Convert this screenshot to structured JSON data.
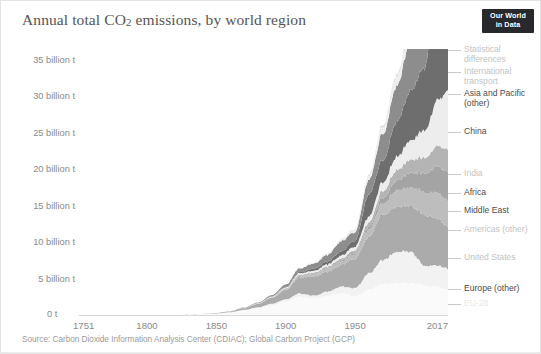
{
  "header": {
    "title_main": "Annual total CO",
    "title_sub": "2",
    "title_rest": " emissions, by world region",
    "logo_line1": "Our World",
    "logo_line2": "in Data"
  },
  "source": {
    "text": "Source: Carbon Dioxide Information Analysis Center (CDIAC); Global Carbon Project (GCP)"
  },
  "legend": [
    {
      "label": "Statistical\ndifferences",
      "color": "#e0e0e0",
      "top": 0
    },
    {
      "label": "International\ntransport",
      "color": "#efefef",
      "top": 22
    },
    {
      "label": "Asia and Pacific\n(other)",
      "color": "#8d8d8d",
      "top": 44
    },
    {
      "label": "China",
      "color": "#6e6e6e",
      "top": 82
    },
    {
      "label": "India",
      "color": "#ededed",
      "top": 124
    },
    {
      "label": "Africa",
      "color": "#b4b4b4",
      "top": 143
    },
    {
      "label": "Middle East",
      "color": "#a4a4a4",
      "top": 161
    },
    {
      "label": "Americas (other)",
      "color": "#bdbdbd",
      "top": 180
    },
    {
      "label": "United States",
      "color": "#ababab",
      "top": 208
    },
    {
      "label": "Europe (other)",
      "color": "#f2f2f2",
      "top": 239
    },
    {
      "label": "EU-28",
      "color": "#fafafa",
      "top": 254
    }
  ],
  "chart_data": {
    "type": "area",
    "stacked": true,
    "title": "Annual total CO2 emissions, by world region",
    "xlabel": "",
    "ylabel": "",
    "xlim": [
      1751,
      2017
    ],
    "ylim": [
      0,
      36500000000
    ],
    "grid": false,
    "legend_position": "right",
    "ytick_labels": [
      "0 t",
      "5 billion t",
      "10 billion t",
      "15 billion t",
      "20 billion t",
      "25 billion t",
      "30 billion t",
      "35 billion t"
    ],
    "ytick_values": [
      0,
      5000000000,
      10000000000,
      15000000000,
      20000000000,
      25000000000,
      30000000000,
      35000000000
    ],
    "xtick_labels": [
      "1751",
      "1800",
      "1850",
      "1900",
      "1950",
      "2017"
    ],
    "xtick_values": [
      1751,
      1800,
      1850,
      1900,
      1950,
      2017
    ],
    "y_unit": "tonnes CO2",
    "x": [
      1751,
      1800,
      1820,
      1840,
      1850,
      1860,
      1870,
      1880,
      1890,
      1900,
      1910,
      1920,
      1930,
      1940,
      1950,
      1960,
      1970,
      1980,
      1990,
      2000,
      2010,
      2017
    ],
    "series": [
      {
        "name": "EU-28",
        "color": "#fafafa",
        "values": [
          0.009,
          0.03,
          0.05,
          0.12,
          0.2,
          0.35,
          0.64,
          0.95,
          1.36,
          1.85,
          2.5,
          2.3,
          2.6,
          3.0,
          2.6,
          3.5,
          4.2,
          4.4,
          4.4,
          4.1,
          3.8,
          3.5
        ]
      },
      {
        "name": "Europe (other)",
        "color": "#f2f2f2",
        "values": [
          0.0,
          0.0,
          0.0,
          0.01,
          0.02,
          0.03,
          0.06,
          0.1,
          0.18,
          0.3,
          0.45,
          0.35,
          0.6,
          0.9,
          1.1,
          2.2,
          3.3,
          4.3,
          4.3,
          2.7,
          2.9,
          2.9
        ]
      },
      {
        "name": "United States",
        "color": "#ababab",
        "values": [
          0.0,
          0.0,
          0.0,
          0.02,
          0.05,
          0.1,
          0.23,
          0.45,
          0.8,
          1.3,
          2.2,
          2.6,
          2.7,
          3.0,
          4.0,
          5.0,
          6.3,
          6.2,
          6.3,
          7.0,
          6.4,
          5.7
        ]
      },
      {
        "name": "Americas (other)",
        "color": "#bdbdbd",
        "values": [
          0.0,
          0.0,
          0.0,
          0.0,
          0.0,
          0.01,
          0.02,
          0.04,
          0.07,
          0.12,
          0.2,
          0.3,
          0.35,
          0.4,
          0.6,
          1.0,
          1.5,
          2.2,
          2.5,
          3.1,
          3.6,
          3.6
        ]
      },
      {
        "name": "Middle East",
        "color": "#a4a4a4",
        "values": [
          0.0,
          0.0,
          0.0,
          0.0,
          0.0,
          0.0,
          0.0,
          0.0,
          0.01,
          0.02,
          0.04,
          0.06,
          0.1,
          0.15,
          0.2,
          0.4,
          0.8,
          1.4,
          2.0,
          2.6,
          3.6,
          4.0
        ]
      },
      {
        "name": "Africa",
        "color": "#b4b4b4",
        "values": [
          0.0,
          0.0,
          0.0,
          0.0,
          0.0,
          0.01,
          0.01,
          0.02,
          0.04,
          0.08,
          0.12,
          0.18,
          0.25,
          0.3,
          0.4,
          0.6,
          0.9,
          1.4,
          1.8,
          2.1,
          2.8,
          3.1
        ]
      },
      {
        "name": "India",
        "color": "#ededed",
        "values": [
          0.0,
          0.0,
          0.0,
          0.0,
          0.0,
          0.01,
          0.02,
          0.04,
          0.07,
          0.12,
          0.2,
          0.25,
          0.3,
          0.4,
          0.5,
          0.8,
          1.2,
          1.8,
          2.6,
          3.7,
          6.3,
          8.0
        ]
      },
      {
        "name": "China",
        "color": "#6e6e6e",
        "values": [
          0.0,
          0.0,
          0.0,
          0.0,
          0.0,
          0.0,
          0.01,
          0.02,
          0.04,
          0.08,
          0.15,
          0.3,
          0.4,
          0.6,
          0.8,
          3.0,
          3.0,
          4.8,
          6.8,
          8.5,
          19.0,
          22.5
        ]
      },
      {
        "name": "Asia and Pacific (other)",
        "color": "#8d8d8d",
        "values": [
          0.0,
          0.0,
          0.0,
          0.0,
          0.01,
          0.02,
          0.04,
          0.08,
          0.15,
          0.3,
          0.5,
          0.7,
          0.9,
          1.4,
          1.2,
          2.0,
          3.6,
          5.0,
          6.8,
          8.6,
          11.5,
          12.5
        ]
      },
      {
        "name": "International transport",
        "color": "#efefef",
        "values": [
          0.0,
          0.0,
          0.0,
          0.0,
          0.0,
          0.0,
          0.0,
          0.0,
          0.0,
          0.02,
          0.05,
          0.1,
          0.15,
          0.2,
          0.3,
          0.5,
          0.9,
          1.2,
          1.3,
          1.6,
          2.1,
          2.3
        ]
      },
      {
        "name": "Statistical differences",
        "color": "#e0e0e0",
        "values": [
          0.0,
          0.0,
          0.0,
          0.0,
          0.0,
          0.0,
          0.0,
          0.0,
          0.0,
          0.0,
          0.02,
          0.03,
          0.05,
          0.08,
          0.1,
          0.2,
          0.3,
          0.4,
          0.5,
          0.6,
          0.7,
          0.8
        ]
      }
    ],
    "units_note": "series values expressed in billion tonnes CO2"
  }
}
